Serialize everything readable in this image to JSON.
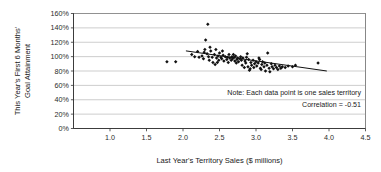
{
  "chart_data": {
    "type": "scatter",
    "title": "",
    "xlabel": "Last Year's Territory Sales ($ millions)",
    "ylabel_line1": "This Year's First 6 Months'",
    "ylabel_line2": "Goal Attainment",
    "xlim": [
      0.5,
      4.5
    ],
    "ylim": [
      0,
      160
    ],
    "x_ticks": [
      1.0,
      1.5,
      2.0,
      2.5,
      3.0,
      3.5,
      4.0,
      4.5
    ],
    "x_tick_labels": [
      "1.0",
      "1.5",
      "2.0",
      "2.5",
      "3.0",
      "3.5",
      "4.0",
      "4.5"
    ],
    "y_ticks": [
      0,
      20,
      40,
      60,
      80,
      100,
      120,
      140,
      160
    ],
    "y_tick_labels": [
      "0%",
      "20%",
      "40%",
      "60%",
      "80%",
      "100%",
      "120%",
      "140%",
      "160%"
    ],
    "grid": "horizontal",
    "legend": "none",
    "correlation": -0.51,
    "annotations": [
      "Note: Each data point is one sales territory",
      "Correlation = -0.51"
    ],
    "trend_line": {
      "x_start": 2.04,
      "y_start": 108.0,
      "x_end": 3.97,
      "y_end": 80.0
    },
    "point_marker": "diamond",
    "points": [
      [
        1.78,
        93
      ],
      [
        1.9,
        93
      ],
      [
        2.12,
        103
      ],
      [
        2.16,
        100
      ],
      [
        2.2,
        107
      ],
      [
        2.22,
        99
      ],
      [
        2.26,
        101
      ],
      [
        2.28,
        97
      ],
      [
        2.3,
        110
      ],
      [
        2.31,
        123
      ],
      [
        2.33,
        104
      ],
      [
        2.34,
        145
      ],
      [
        2.35,
        100
      ],
      [
        2.36,
        95
      ],
      [
        2.38,
        108
      ],
      [
        2.4,
        99
      ],
      [
        2.41,
        92
      ],
      [
        2.43,
        103
      ],
      [
        2.45,
        110
      ],
      [
        2.46,
        98
      ],
      [
        2.48,
        101
      ],
      [
        2.49,
        95
      ],
      [
        2.5,
        105
      ],
      [
        2.52,
        99
      ],
      [
        2.53,
        97
      ],
      [
        2.55,
        102
      ],
      [
        2.56,
        94
      ],
      [
        2.58,
        100
      ],
      [
        2.6,
        96
      ],
      [
        2.61,
        99
      ],
      [
        2.63,
        103
      ],
      [
        2.64,
        98
      ],
      [
        2.66,
        95
      ],
      [
        2.67,
        100
      ],
      [
        2.68,
        97
      ],
      [
        2.7,
        99
      ],
      [
        2.71,
        94
      ],
      [
        2.72,
        101
      ],
      [
        2.74,
        96
      ],
      [
        2.75,
        98
      ],
      [
        2.76,
        93
      ],
      [
        2.78,
        97
      ],
      [
        2.79,
        100
      ],
      [
        2.8,
        95
      ],
      [
        2.81,
        88
      ],
      [
        2.82,
        98
      ],
      [
        2.84,
        85
      ],
      [
        2.85,
        94
      ],
      [
        2.86,
        91
      ],
      [
        2.88,
        104
      ],
      [
        2.89,
        86
      ],
      [
        2.9,
        96
      ],
      [
        2.92,
        83
      ],
      [
        2.93,
        92
      ],
      [
        2.94,
        88
      ],
      [
        2.96,
        95
      ],
      [
        2.97,
        85
      ],
      [
        2.98,
        90
      ],
      [
        3.0,
        93
      ],
      [
        3.01,
        87
      ],
      [
        3.03,
        91
      ],
      [
        3.05,
        96
      ],
      [
        3.06,
        84
      ],
      [
        3.08,
        89
      ],
      [
        3.09,
        93
      ],
      [
        3.11,
        86
      ],
      [
        3.12,
        91
      ],
      [
        3.13,
        80
      ],
      [
        3.15,
        88
      ],
      [
        3.16,
        105
      ],
      [
        3.18,
        84
      ],
      [
        3.19,
        79
      ],
      [
        3.21,
        90
      ],
      [
        3.22,
        86
      ],
      [
        3.24,
        83
      ],
      [
        3.26,
        88
      ],
      [
        3.28,
        85
      ],
      [
        3.3,
        82
      ],
      [
        3.32,
        87
      ],
      [
        3.34,
        84
      ],
      [
        3.36,
        86
      ],
      [
        3.4,
        85
      ],
      [
        3.44,
        87
      ],
      [
        3.5,
        86
      ],
      [
        3.54,
        88
      ],
      [
        3.85,
        91
      ],
      [
        2.44,
        89
      ],
      [
        2.62,
        92
      ],
      [
        2.87,
        99
      ],
      [
        3.04,
        98
      ],
      [
        2.54,
        108
      ],
      [
        2.37,
        113
      ],
      [
        2.29,
        106
      ],
      [
        2.73,
        91
      ],
      [
        2.91,
        81
      ],
      [
        3.07,
        82
      ],
      [
        2.47,
        92
      ],
      [
        2.69,
        103
      ]
    ]
  }
}
